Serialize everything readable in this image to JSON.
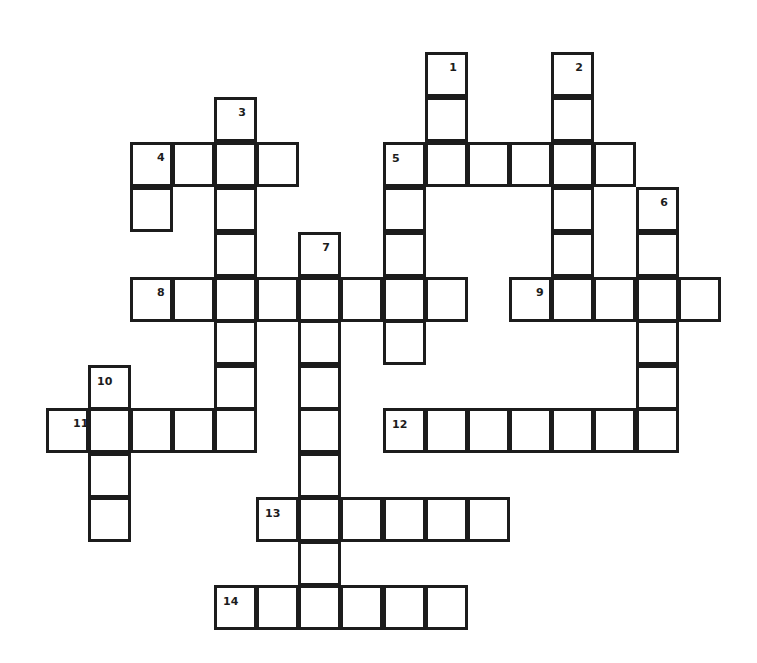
{
  "puzzle": {
    "type": "crossword",
    "cell_w": 43,
    "cell_h": 45,
    "columns_x": [
      46,
      88,
      130,
      172,
      214,
      256,
      298,
      340,
      383,
      425,
      467,
      509,
      551,
      593,
      636,
      678
    ],
    "rows_y": [
      52,
      97,
      142,
      187,
      232,
      277,
      320,
      365,
      408,
      453,
      497,
      541,
      585
    ],
    "line_color": "#1c1c1c",
    "cells": [
      {
        "c": 9,
        "r": 0,
        "num": "1",
        "pos": "right"
      },
      {
        "c": 9,
        "r": 1
      },
      {
        "c": 12,
        "r": 0,
        "num": "2",
        "pos": "right"
      },
      {
        "c": 12,
        "r": 1
      },
      {
        "c": 4,
        "r": 1,
        "num": "3",
        "pos": "right"
      },
      {
        "c": 2,
        "r": 2,
        "num": "4",
        "pos": "mid"
      },
      {
        "c": 3,
        "r": 2
      },
      {
        "c": 4,
        "r": 2
      },
      {
        "c": 5,
        "r": 2
      },
      {
        "c": 2,
        "r": 3
      },
      {
        "c": 8,
        "r": 2,
        "num": "5",
        "pos": "left"
      },
      {
        "c": 9,
        "r": 2
      },
      {
        "c": 10,
        "r": 2
      },
      {
        "c": 11,
        "r": 2
      },
      {
        "c": 12,
        "r": 2
      },
      {
        "c": 13,
        "r": 2
      },
      {
        "c": 4,
        "r": 3
      },
      {
        "c": 4,
        "r": 4
      },
      {
        "c": 8,
        "r": 3
      },
      {
        "c": 8,
        "r": 4
      },
      {
        "c": 8,
        "r": 6
      },
      {
        "c": 12,
        "r": 3
      },
      {
        "c": 12,
        "r": 4
      },
      {
        "c": 14,
        "r": 3,
        "num": "6",
        "pos": "right"
      },
      {
        "c": 14,
        "r": 4
      },
      {
        "c": 6,
        "r": 4,
        "num": "7",
        "pos": "right"
      },
      {
        "c": 2,
        "r": 5,
        "num": "8",
        "pos": "mid"
      },
      {
        "c": 3,
        "r": 5
      },
      {
        "c": 4,
        "r": 5
      },
      {
        "c": 5,
        "r": 5
      },
      {
        "c": 6,
        "r": 5
      },
      {
        "c": 7,
        "r": 5
      },
      {
        "c": 8,
        "r": 5
      },
      {
        "c": 9,
        "r": 5
      },
      {
        "c": 11,
        "r": 5,
        "num": "9",
        "pos": "mid"
      },
      {
        "c": 12,
        "r": 5
      },
      {
        "c": 13,
        "r": 5
      },
      {
        "c": 14,
        "r": 5
      },
      {
        "c": 15,
        "r": 5
      },
      {
        "c": 4,
        "r": 6
      },
      {
        "c": 4,
        "r": 7
      },
      {
        "c": 6,
        "r": 6
      },
      {
        "c": 6,
        "r": 7
      },
      {
        "c": 6,
        "r": 8
      },
      {
        "c": 6,
        "r": 9
      },
      {
        "c": 6,
        "r": 11
      },
      {
        "c": 14,
        "r": 6
      },
      {
        "c": 14,
        "r": 7
      },
      {
        "c": 1,
        "r": 7,
        "num": "10",
        "pos": "left"
      },
      {
        "c": 0,
        "r": 8,
        "num": "11",
        "pos": "mid"
      },
      {
        "c": 1,
        "r": 8
      },
      {
        "c": 2,
        "r": 8
      },
      {
        "c": 3,
        "r": 8
      },
      {
        "c": 4,
        "r": 8
      },
      {
        "c": 8,
        "r": 8,
        "num": "12",
        "pos": "left"
      },
      {
        "c": 9,
        "r": 8
      },
      {
        "c": 10,
        "r": 8
      },
      {
        "c": 11,
        "r": 8
      },
      {
        "c": 12,
        "r": 8
      },
      {
        "c": 13,
        "r": 8
      },
      {
        "c": 14,
        "r": 8
      },
      {
        "c": 1,
        "r": 9
      },
      {
        "c": 1,
        "r": 10
      },
      {
        "c": 5,
        "r": 10,
        "num": "13",
        "pos": "left"
      },
      {
        "c": 6,
        "r": 10
      },
      {
        "c": 7,
        "r": 10
      },
      {
        "c": 8,
        "r": 10
      },
      {
        "c": 9,
        "r": 10
      },
      {
        "c": 10,
        "r": 10
      },
      {
        "c": 4,
        "r": 12,
        "num": "14",
        "pos": "left"
      },
      {
        "c": 5,
        "r": 12
      },
      {
        "c": 6,
        "r": 12
      },
      {
        "c": 7,
        "r": 12
      },
      {
        "c": 8,
        "r": 12
      },
      {
        "c": 9,
        "r": 12
      }
    ],
    "clue_numbers": [
      "1",
      "2",
      "3",
      "4",
      "5",
      "6",
      "7",
      "8",
      "9",
      "10",
      "11",
      "12",
      "13",
      "14"
    ],
    "across": [
      {
        "number": "4",
        "length": 4
      },
      {
        "number": "5",
        "length": 6
      },
      {
        "number": "8",
        "length": 8
      },
      {
        "number": "9",
        "length": 5
      },
      {
        "number": "11",
        "length": 5
      },
      {
        "number": "12",
        "length": 7
      },
      {
        "number": "13",
        "length": 6
      },
      {
        "number": "14",
        "length": 6
      }
    ],
    "down": [
      {
        "number": "1",
        "length": 3
      },
      {
        "number": "2",
        "length": 6
      },
      {
        "number": "3",
        "length": 8
      },
      {
        "number": "5",
        "length": 5
      },
      {
        "number": "6",
        "length": 6
      },
      {
        "number": "7",
        "length": 9
      },
      {
        "number": "10",
        "length": 4
      }
    ]
  }
}
